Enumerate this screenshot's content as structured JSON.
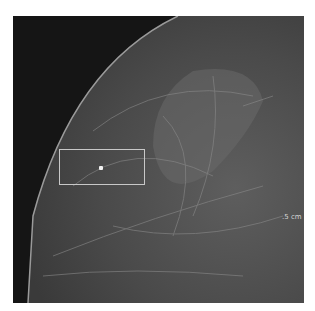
{
  "image": {
    "type": "mammogram",
    "annotation_box": {
      "x": 46,
      "y": 133,
      "width": 86,
      "height": 36
    },
    "marker_dot": {
      "x": 86,
      "y": 150
    },
    "scale_label": ".5 cm",
    "colors": {
      "background": "#151515",
      "tissue": "#5a5a5a",
      "box": "#c8c8c8"
    }
  }
}
